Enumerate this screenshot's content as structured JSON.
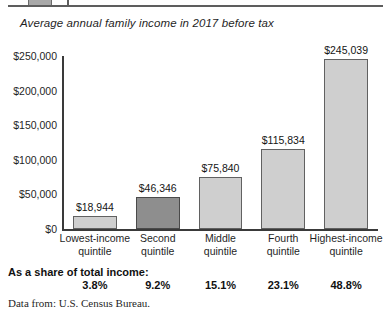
{
  "chart_data": {
    "type": "bar",
    "title": "Average annual family income in 2017 before tax",
    "xlabel": "",
    "ylabel": "",
    "ylim": [
      0,
      250000
    ],
    "ytick_labels": [
      "$0",
      "$50,000",
      "$100,000",
      "$150,000",
      "$200,000",
      "$250,000"
    ],
    "ytick_values": [
      0,
      50000,
      100000,
      150000,
      200000,
      250000
    ],
    "grid": false,
    "legend": "none",
    "categories": [
      "Lowest-income quintile",
      "Second quintile",
      "Middle quintile",
      "Fourth quintile",
      "Highest-income quintile"
    ],
    "category_lines": [
      [
        "Lowest-income",
        "quintile"
      ],
      [
        "Second",
        "quintile"
      ],
      [
        "Middle",
        "quintile"
      ],
      [
        "Fourth",
        "quintile"
      ],
      [
        "Highest-income",
        "quintile"
      ]
    ],
    "values": [
      18944,
      46346,
      75840,
      115834,
      245039
    ],
    "value_labels": [
      "$18,944",
      "$46,346",
      "$75,840",
      "$115,834",
      "$245,039"
    ],
    "bar_highlight_index": 1,
    "share_of_total_income": [
      "3.8%",
      "9.2%",
      "15.1%",
      "23.1%",
      "48.8%"
    ],
    "share_values": [
      3.8,
      9.2,
      15.1,
      23.1,
      48.8
    ],
    "colors": {
      "bar_fill": "#cfcfcf",
      "bar_fill_highlight": "#8e8e8e",
      "bar_border": "#616161",
      "axis": "#3a3a3a",
      "text": "#1f1f1f",
      "background": "#ffffff"
    }
  },
  "footer": {
    "share_label_line1": "As a share of",
    "share_label_line2": "total income:",
    "source": "Data from: U.S. Census Bureau."
  }
}
